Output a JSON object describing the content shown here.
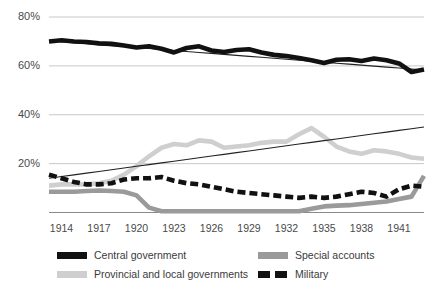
{
  "chart_data": {
    "type": "line",
    "title": "",
    "subtitle": "",
    "xlabel": "",
    "ylabel": "",
    "grid": true,
    "legend_position": "bottom",
    "ylim": [
      0,
      80
    ],
    "xlim": [
      1913,
      1943
    ],
    "y_ticks": [
      "20%",
      "40%",
      "60%",
      "80%"
    ],
    "y_tick_values": [
      20,
      40,
      60,
      80
    ],
    "x_ticks": [
      "1914",
      "1917",
      "1920",
      "1923",
      "1926",
      "1929",
      "1932",
      "1935",
      "1938",
      "1941"
    ],
    "x_tick_values": [
      1914,
      1917,
      1920,
      1923,
      1926,
      1929,
      1932,
      1935,
      1938,
      1941
    ],
    "x": [
      1913,
      1914,
      1915,
      1916,
      1917,
      1918,
      1919,
      1920,
      1921,
      1922,
      1923,
      1924,
      1925,
      1926,
      1927,
      1928,
      1929,
      1930,
      1931,
      1932,
      1933,
      1934,
      1935,
      1936,
      1937,
      1938,
      1939,
      1940,
      1941,
      1942,
      1943
    ],
    "series": [
      {
        "name": "Central government",
        "color": "#111111",
        "style": "solid-thick",
        "values": [
          70.0,
          70.5,
          70.0,
          69.8,
          69.2,
          69.0,
          68.3,
          67.5,
          68.0,
          67.0,
          65.5,
          67.3,
          68.0,
          66.3,
          65.7,
          66.5,
          66.8,
          65.5,
          64.5,
          64.0,
          63.2,
          62.3,
          61.2,
          62.5,
          62.7,
          62.0,
          63.0,
          62.3,
          61.0,
          57.5,
          58.5
        ]
      },
      {
        "name": "Central government trend",
        "color": "#222222",
        "style": "thin-trend",
        "values": [
          70.3,
          69.9,
          69.5,
          69.1,
          68.7,
          68.3,
          67.9,
          67.5,
          67.1,
          66.7,
          66.3,
          65.9,
          65.5,
          65.1,
          64.7,
          64.3,
          63.9,
          63.5,
          63.1,
          62.7,
          62.3,
          61.9,
          61.5,
          61.1,
          60.7,
          60.3,
          59.9,
          59.5,
          59.1,
          58.7,
          58.3
        ]
      },
      {
        "name": "Provincial and local governments",
        "color": "#cfcfcf",
        "style": "solid-thick",
        "values": [
          11.0,
          11.5,
          11.5,
          11.5,
          12.0,
          13.0,
          15.5,
          19.0,
          23.0,
          26.5,
          28.0,
          27.5,
          29.5,
          29.0,
          26.5,
          27.0,
          27.5,
          28.5,
          29.0,
          29.0,
          32.0,
          34.5,
          31.0,
          27.0,
          25.0,
          24.0,
          25.5,
          25.0,
          24.0,
          22.5,
          22.0
        ]
      },
      {
        "name": "Provincial trend",
        "color": "#222222",
        "style": "thin-trend",
        "values": [
          14.0,
          14.7,
          15.4,
          16.1,
          16.8,
          17.5,
          18.2,
          18.9,
          19.6,
          20.3,
          21.0,
          21.7,
          22.4,
          23.1,
          23.8,
          24.5,
          25.2,
          25.9,
          26.6,
          27.3,
          28.0,
          28.7,
          29.4,
          30.1,
          30.8,
          31.5,
          32.2,
          32.9,
          33.6,
          34.3,
          35.0
        ]
      },
      {
        "name": "Special accounts",
        "color": "#9a9a9a",
        "style": "solid-thick",
        "values": [
          8.5,
          8.5,
          8.5,
          8.8,
          9.0,
          8.8,
          8.5,
          7.0,
          2.0,
          0.5,
          0.5,
          0.5,
          0.5,
          0.5,
          0.5,
          0.5,
          0.5,
          0.5,
          0.5,
          0.5,
          0.5,
          1.5,
          2.5,
          2.8,
          3.0,
          3.5,
          4.0,
          4.5,
          5.5,
          6.5,
          15.0
        ]
      },
      {
        "name": "Military",
        "color": "#111111",
        "style": "dashed",
        "values": [
          15.5,
          14.0,
          12.5,
          11.5,
          11.5,
          12.0,
          13.5,
          14.0,
          14.0,
          14.5,
          13.0,
          12.0,
          11.5,
          10.5,
          9.5,
          8.5,
          8.0,
          7.5,
          7.0,
          6.5,
          6.0,
          6.5,
          6.0,
          6.5,
          7.5,
          8.5,
          8.0,
          6.5,
          9.5,
          11.0,
          10.5
        ]
      }
    ]
  },
  "legend": {
    "items": [
      {
        "label": "Central government",
        "color": "#111111",
        "style": "solid",
        "swatch": "central-government-swatch"
      },
      {
        "label": "Special accounts",
        "color": "#9a9a9a",
        "style": "solid",
        "swatch": "special-accounts-swatch"
      },
      {
        "label": "Provincial and local governments",
        "color": "#cfcfcf",
        "style": "solid",
        "swatch": "provincial-local-governments-swatch"
      },
      {
        "label": "Military",
        "color": "#111111",
        "style": "dashed",
        "swatch": "military-swatch"
      }
    ]
  },
  "colors": {
    "gridline": "#c8c8c8",
    "axis_text": "#4a4a4a",
    "background": "#ffffff"
  }
}
